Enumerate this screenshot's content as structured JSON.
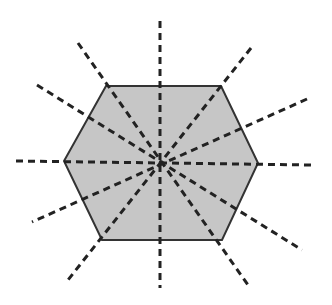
{
  "diagram": {
    "shape": "hexagon",
    "fill_color": "#c6c6c6",
    "stroke_color": "#333333",
    "dash_color": "#222222",
    "center": [
      160,
      162
    ],
    "vertices": [
      [
        106,
        86
      ],
      [
        221,
        86
      ],
      [
        258,
        163
      ],
      [
        222,
        240
      ],
      [
        102,
        240
      ],
      [
        64,
        161
      ]
    ],
    "symmetry_line_count": 6,
    "symmetry_lines": [
      {
        "kind": "vertical",
        "from": [
          160,
          21
        ],
        "to": [
          160,
          288
        ]
      },
      {
        "kind": "horizontal",
        "from": [
          16,
          161
        ],
        "to": [
          312,
          165
        ]
      },
      {
        "kind": "vertex-to-vertex",
        "from": [
          78,
          43
        ],
        "to": [
          248,
          285
        ]
      },
      {
        "kind": "vertex-to-vertex",
        "from": [
          251,
          48
        ],
        "to": [
          68,
          280
        ]
      },
      {
        "kind": "edge-midpoint",
        "from": [
          37,
          85
        ],
        "to": [
          302,
          250
        ]
      },
      {
        "kind": "edge-midpoint",
        "from": [
          307,
          99
        ],
        "to": [
          32,
          222
        ]
      }
    ]
  }
}
